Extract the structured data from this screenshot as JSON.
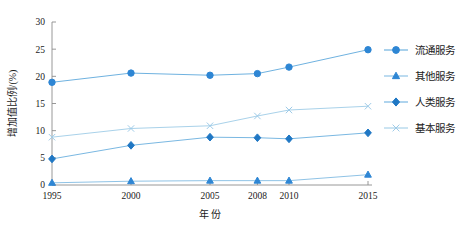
{
  "chart_data": {
    "type": "line",
    "title": "",
    "xlabel": "年 份",
    "ylabel": "增加值比例/(%)",
    "categories": [
      "1995",
      "2000",
      "2005",
      "2008",
      "2010",
      "2015"
    ],
    "x_positions": [
      1995,
      2000,
      2005,
      2008,
      2010,
      2015
    ],
    "ylim": [
      0,
      30
    ],
    "yticks": [
      0,
      5,
      10,
      15,
      20,
      25,
      30
    ],
    "ytick_labels": [
      "0",
      "5",
      "10",
      "15",
      "20",
      "25",
      "30"
    ],
    "grid": false,
    "legend_position": "right",
    "series": [
      {
        "name": "流通服务",
        "marker": "circle",
        "color": "#2e86d4",
        "line_color": "#6fb2e0",
        "values": [
          18.9,
          20.6,
          20.2,
          20.5,
          21.7,
          24.9
        ]
      },
      {
        "name": "其他服务",
        "marker": "triangle",
        "color": "#2e86d4",
        "line_color": "#8fc3e6",
        "values": [
          0.4,
          0.7,
          0.8,
          0.8,
          0.8,
          1.9
        ]
      },
      {
        "name": "人类服务",
        "marker": "diamond",
        "color": "#1f77c4",
        "line_color": "#7ab8e2",
        "values": [
          4.8,
          7.3,
          8.8,
          8.7,
          8.5,
          9.6
        ]
      },
      {
        "name": "基本服务",
        "marker": "cross",
        "color": "#9ecbe8",
        "line_color": "#a9d2ea",
        "values": [
          8.8,
          10.4,
          10.9,
          12.7,
          13.8,
          14.5
        ]
      }
    ]
  },
  "legend": {
    "items": [
      {
        "label": "流通服务",
        "marker": "circle"
      },
      {
        "label": "其他服务",
        "marker": "triangle"
      },
      {
        "label": "人类服务",
        "marker": "diamond"
      },
      {
        "label": "基本服务",
        "marker": "cross"
      }
    ]
  },
  "axes": {
    "y_title": "增加值比例/(%)",
    "x_title": "年 份"
  },
  "colors": {
    "accent": "#2e86d4",
    "light_accent": "#9ecbe8",
    "axis": "#8c8c8c",
    "text": "#1a1a1a",
    "background": "#ffffff"
  }
}
